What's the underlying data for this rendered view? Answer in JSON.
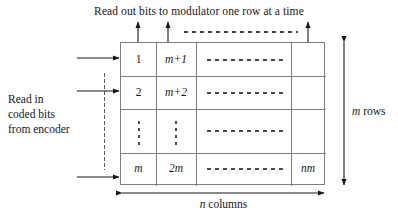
{
  "figure": {
    "type": "block-interleaver-diagram",
    "title_top": "Read out bits to modulator one row at a time",
    "label_left_lines": [
      "Read in",
      "coded bits",
      "from encoder"
    ],
    "label_right": "m rows",
    "label_bottom": "n columns",
    "grid": {
      "rows": 4,
      "columns": 4,
      "row_meaning": [
        "row 1",
        "row 2",
        "vertical ellipsis row",
        "row m"
      ],
      "cells": [
        [
          "1",
          "m+1",
          "· · · · · · · ·",
          ""
        ],
        [
          "2",
          "m+2",
          "· · · · · · · ·",
          ""
        ],
        [
          "⋮",
          "⋮",
          "· · · · · · · ·",
          ""
        ],
        [
          "m",
          "2m",
          "· · · · · · · ·",
          "nm"
        ]
      ]
    },
    "arrows": {
      "in_count": 3,
      "in_direction": "right",
      "out_count": 3,
      "out_direction": "up",
      "dim_right": "double-ended-vertical",
      "dim_bottom": "double-ended-horizontal"
    },
    "colors": {
      "ink": "#161616",
      "grid_line": "#7d7d7d",
      "dots": "#4a4a4a",
      "background": "#ffffff"
    }
  }
}
